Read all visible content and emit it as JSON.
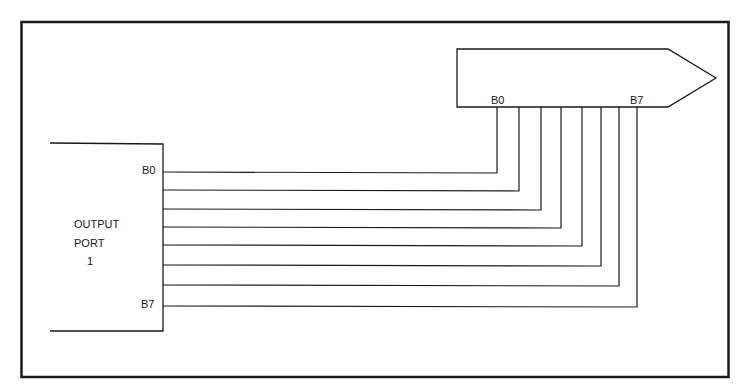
{
  "diagram": {
    "colors": {
      "line": "#1a1a1a",
      "background": "#ffffff"
    },
    "output_port": {
      "label_line1": "OUTPUT",
      "label_line2": "PORT",
      "label_line3": "1",
      "top_bit_label": "B0",
      "bottom_bit_label": "B7"
    },
    "bus_arrow": {
      "left_bit_label": "B0",
      "right_bit_label": "B7"
    },
    "connections": [
      {
        "from": "B0",
        "to": "B0"
      },
      {
        "from": "B1",
        "to": "B1"
      },
      {
        "from": "B2",
        "to": "B2"
      },
      {
        "from": "B3",
        "to": "B3"
      },
      {
        "from": "B4",
        "to": "B4"
      },
      {
        "from": "B5",
        "to": "B5"
      },
      {
        "from": "B6",
        "to": "B6"
      },
      {
        "from": "B7",
        "to": "B7"
      }
    ]
  }
}
